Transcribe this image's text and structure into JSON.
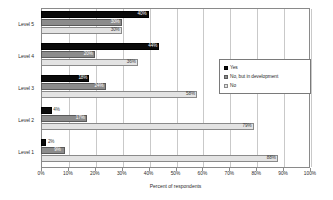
{
  "chart_data": {
    "type": "bar",
    "orientation": "horizontal",
    "title": "",
    "xlabel": "Percent of respondents",
    "ylabel": "",
    "xlim": [
      0,
      100
    ],
    "xticks": [
      "0%",
      "10%",
      "20%",
      "30%",
      "40%",
      "50%",
      "60%",
      "70%",
      "80%",
      "90%",
      "100%"
    ],
    "xtick_values": [
      0,
      10,
      20,
      30,
      40,
      50,
      60,
      70,
      80,
      90,
      100
    ],
    "grid": true,
    "grid_axis": "x",
    "legend_position": "right-upper",
    "categories": [
      "Level 5",
      "Level 4",
      "Level 3",
      "Level 2",
      "Level 1"
    ],
    "series": [
      {
        "name": "Yes",
        "color": "#0a0a0a",
        "values": [
          40,
          44,
          18,
          4,
          2
        ],
        "labels": [
          "40%",
          "44%",
          "18%",
          "4%",
          "2%"
        ]
      },
      {
        "name": "No, but in development",
        "color": "#8c8c8c",
        "values": [
          30,
          20,
          24,
          17,
          9
        ],
        "labels": [
          "30%",
          "20%",
          "24%",
          "17%",
          "9%"
        ]
      },
      {
        "name": "No",
        "color": "#e3e3e3",
        "values": [
          30,
          36,
          58,
          79,
          88
        ],
        "labels": [
          "30%",
          "36%",
          "58%",
          "79%",
          "88%"
        ]
      }
    ]
  },
  "legend": {
    "items": [
      {
        "label": "Yes"
      },
      {
        "label": "No, but in development"
      },
      {
        "label": "No"
      }
    ]
  }
}
